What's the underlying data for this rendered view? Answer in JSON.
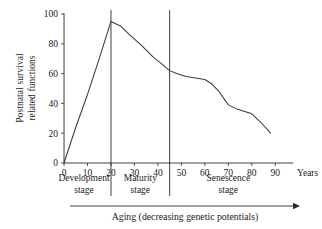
{
  "chart_data": {
    "type": "line",
    "title": "",
    "xlabel": "Years",
    "ylabel_line1": "Postnatal survival",
    "ylabel_line2": "related functions",
    "xlim": [
      -3,
      95
    ],
    "ylim": [
      0,
      100
    ],
    "grid": false,
    "legend": "none",
    "x_ticks": [
      0,
      10,
      20,
      30,
      40,
      50,
      60,
      70,
      80,
      90
    ],
    "x_tick_labels": [
      "0",
      "10",
      "20",
      "30",
      "40",
      "50",
      "60",
      "70",
      "80",
      "90"
    ],
    "y_ticks": [
      0,
      20,
      40,
      60,
      80,
      100
    ],
    "y_tick_labels": [
      "0",
      "20",
      "40",
      "60",
      "80",
      "100"
    ],
    "series": [
      {
        "name": "Postnatal survival related functions",
        "x": [
          0,
          5,
          10,
          15,
          20,
          24,
          28,
          33,
          38,
          42,
          45,
          48,
          52,
          56,
          60,
          63,
          66,
          70,
          74,
          78,
          80,
          84,
          88
        ],
        "values": [
          0,
          24,
          46,
          70,
          95,
          92,
          86,
          79,
          71,
          66,
          62,
          60,
          58,
          57,
          56,
          53,
          48,
          39,
          36,
          34,
          33,
          27,
          20
        ]
      }
    ],
    "dividers": [
      {
        "name": "development-maturity-divider",
        "x": 20
      },
      {
        "name": "maturity-senescence-divider",
        "x": 45
      }
    ],
    "stages": [
      {
        "id": "development",
        "line1": "Development",
        "line2": "stage",
        "x_start": -3,
        "x_end": 20
      },
      {
        "id": "maturity",
        "line1": "Maturity",
        "line2": "stage",
        "x_start": 20,
        "x_end": 45
      },
      {
        "id": "senescence",
        "line1": "Senescence",
        "line2": "stage",
        "x_start": 45,
        "x_end": 95
      }
    ],
    "caption": "Aging (decreasing genetic potentials)",
    "annotations": {
      "arrow_direction": "right",
      "arrow_meaning": "increasing age"
    },
    "colors": {
      "background": "#ffffff",
      "axis": "#2a2a2a",
      "curve": "#3a3a3a",
      "text": "#1a1a1a"
    }
  }
}
